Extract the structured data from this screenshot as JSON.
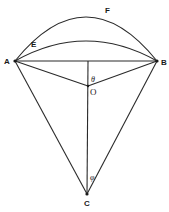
{
  "diagram": {
    "type": "geometry",
    "points": {
      "A": {
        "label": "A",
        "x": 15,
        "y": 61
      },
      "B": {
        "label": "B",
        "x": 157,
        "y": 61
      },
      "O": {
        "label": "O",
        "x": 88,
        "y": 86
      },
      "C": {
        "label": "C",
        "x": 87,
        "y": 194
      }
    },
    "arcs": {
      "E": {
        "label": "E",
        "from": "A",
        "to": "B",
        "peak_y": 41
      },
      "F": {
        "label": "F",
        "from": "A",
        "to": "B",
        "peak_y": 17
      }
    },
    "angles": {
      "theta": {
        "label": "θ",
        "vertex": "O"
      },
      "phi": {
        "label": "φ",
        "vertex": "C"
      }
    },
    "segments": [
      "AB",
      "AO",
      "BO",
      "AC",
      "BC",
      "OC-vertical"
    ]
  }
}
